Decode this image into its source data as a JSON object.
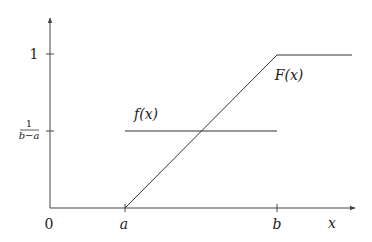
{
  "diagram": {
    "title": "",
    "axes": {
      "origin_label": "0",
      "x_axis_label": "x",
      "x_ticks": [
        {
          "label": "a"
        },
        {
          "label": "b"
        }
      ],
      "y_ticks": [
        {
          "label": "1"
        },
        {
          "label_num": "1",
          "label_den": "b−a"
        }
      ]
    },
    "curves": {
      "density": {
        "label": "f(x)"
      },
      "cdf": {
        "label": "F(x)"
      }
    },
    "colors": {
      "line": "#333333",
      "axis": "#444444",
      "text": "#222222"
    }
  }
}
